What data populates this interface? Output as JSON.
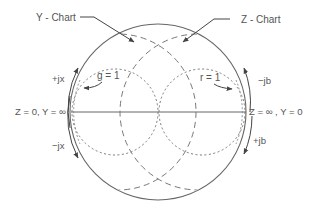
{
  "diagram": {
    "labels": {
      "y_chart": "Y - Chart",
      "z_chart": "Z - Chart",
      "g_circle": "g = 1",
      "r_circle": "r = 1",
      "plus_jx": "+jx",
      "minus_jx": "−jx",
      "minus_jb": "−jb",
      "plus_jb": "+jb",
      "left_point": "Z = 0, Y = ∞",
      "right_point": "Z = ∞ , Y = 0"
    },
    "colors": {
      "line": "#555555",
      "background": "#ffffff"
    }
  }
}
